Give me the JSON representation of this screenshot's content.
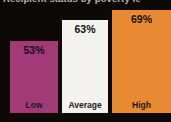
{
  "chart_data": {
    "type": "bar",
    "title": "Recipient status by poverty le",
    "title_note": "title cropped at top edge of screenshot",
    "categories": [
      "Low",
      "Average",
      "High"
    ],
    "values": [
      53,
      63,
      69
    ],
    "value_labels": [
      "53%",
      "63%",
      "69%"
    ],
    "xlabel": "",
    "ylabel": "",
    "legend": "none",
    "grid": "off",
    "background_color": "#0c0907",
    "bar_colors": [
      "#a23a7a",
      "#f4f2ee",
      "#e78a33"
    ],
    "label_color": "#131310",
    "layout": {
      "bar_lefts_px": [
        10,
        62,
        112
      ],
      "bar_widths_px": [
        48,
        46,
        59
      ],
      "bar_heights_px": [
        72,
        93,
        103
      ],
      "baseline_bottom_px": 9
    }
  }
}
